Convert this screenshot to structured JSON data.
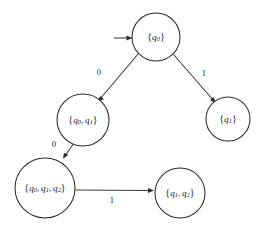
{
  "diagram": {
    "type": "state-transition-diagram",
    "background_color": "#ffffff",
    "stroke_color": "#2b2b2b",
    "text_color": "#1a1a1a",
    "start_marker": "start-arrow",
    "nodes": [
      {
        "id": "n0",
        "label": "{q0}",
        "open_brace": "{",
        "close_brace": "}",
        "elements": [
          {
            "base": "q",
            "sub": "0"
          }
        ],
        "cx": 156,
        "cy": 37,
        "r": 24,
        "is_start": true
      },
      {
        "id": "n1",
        "label": "{q0, q1}",
        "open_brace": "{",
        "close_brace": "}",
        "elements": [
          {
            "base": "q",
            "sub": "0"
          },
          {
            "base": "q",
            "sub": "1"
          }
        ],
        "cx": 83,
        "cy": 120,
        "r": 26,
        "is_start": false
      },
      {
        "id": "n2",
        "label": "{q1}",
        "open_brace": "{",
        "close_brace": "}",
        "elements": [
          {
            "base": "q",
            "sub": "1"
          }
        ],
        "cx": 228,
        "cy": 119,
        "r": 22,
        "is_start": false
      },
      {
        "id": "n3",
        "label": "{q0, q1, q2}",
        "open_brace": "{",
        "close_brace": "}",
        "elements": [
          {
            "base": "q",
            "sub": "0"
          },
          {
            "base": "q",
            "sub": "1"
          },
          {
            "base": "q",
            "sub": "2"
          }
        ],
        "cx": 45,
        "cy": 188,
        "r": 30,
        "is_start": false
      },
      {
        "id": "n4",
        "label": "{q1, q2}",
        "open_brace": "{",
        "close_brace": "}",
        "elements": [
          {
            "base": "q",
            "sub": "1"
          },
          {
            "base": "q",
            "sub": "2"
          }
        ],
        "cx": 180,
        "cy": 193,
        "r": 25,
        "is_start": false
      }
    ],
    "edges": [
      {
        "id": "e0",
        "from": "n0",
        "to": "n1",
        "label": "0",
        "label_x": 99,
        "label_y": 73
      },
      {
        "id": "e1",
        "from": "n0",
        "to": "n2",
        "label": "1",
        "label_x": 204,
        "label_y": 74
      },
      {
        "id": "e2",
        "from": "n1",
        "to": "n3",
        "label": "0",
        "label_x": 54,
        "label_y": 145
      },
      {
        "id": "e3",
        "from": "n3",
        "to": "n4",
        "label": "1",
        "label_x": 112,
        "label_y": 201
      }
    ]
  }
}
